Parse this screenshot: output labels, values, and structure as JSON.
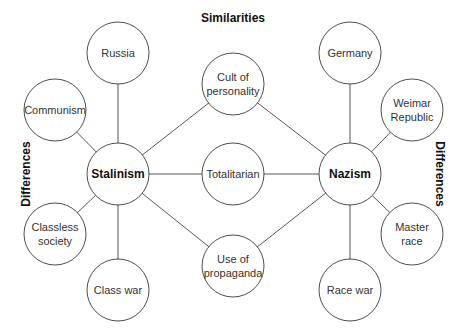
{
  "headings": {
    "top": "Similarities",
    "left": "Differences",
    "right": "Differences"
  },
  "nodes": [
    {
      "id": "stalinism",
      "lines": [
        "Stalinism"
      ],
      "hub": true
    },
    {
      "id": "nazism",
      "lines": [
        "Nazism"
      ],
      "hub": true
    },
    {
      "id": "cult",
      "lines": [
        "Cult of",
        "personality"
      ]
    },
    {
      "id": "totalitarian",
      "lines": [
        "Totalitarian"
      ]
    },
    {
      "id": "propaganda",
      "lines": [
        "Use of",
        "propaganda"
      ]
    },
    {
      "id": "russia",
      "lines": [
        "Russia"
      ]
    },
    {
      "id": "communism",
      "lines": [
        "Communism"
      ]
    },
    {
      "id": "classless",
      "lines": [
        "Classless",
        "society"
      ]
    },
    {
      "id": "classwar",
      "lines": [
        "Class war"
      ]
    },
    {
      "id": "germany",
      "lines": [
        "Germany"
      ]
    },
    {
      "id": "weimar",
      "lines": [
        "Weimar",
        "Republic"
      ]
    },
    {
      "id": "master",
      "lines": [
        "Master",
        "race"
      ]
    },
    {
      "id": "racewar",
      "lines": [
        "Race war"
      ]
    }
  ],
  "edges": [
    [
      "stalinism",
      "cult"
    ],
    [
      "stalinism",
      "totalitarian"
    ],
    [
      "stalinism",
      "propaganda"
    ],
    [
      "nazism",
      "cult"
    ],
    [
      "nazism",
      "totalitarian"
    ],
    [
      "nazism",
      "propaganda"
    ],
    [
      "stalinism",
      "russia"
    ],
    [
      "stalinism",
      "communism"
    ],
    [
      "stalinism",
      "classless"
    ],
    [
      "stalinism",
      "classwar"
    ],
    [
      "nazism",
      "germany"
    ],
    [
      "nazism",
      "weimar"
    ],
    [
      "nazism",
      "master"
    ],
    [
      "nazism",
      "racewar"
    ]
  ]
}
